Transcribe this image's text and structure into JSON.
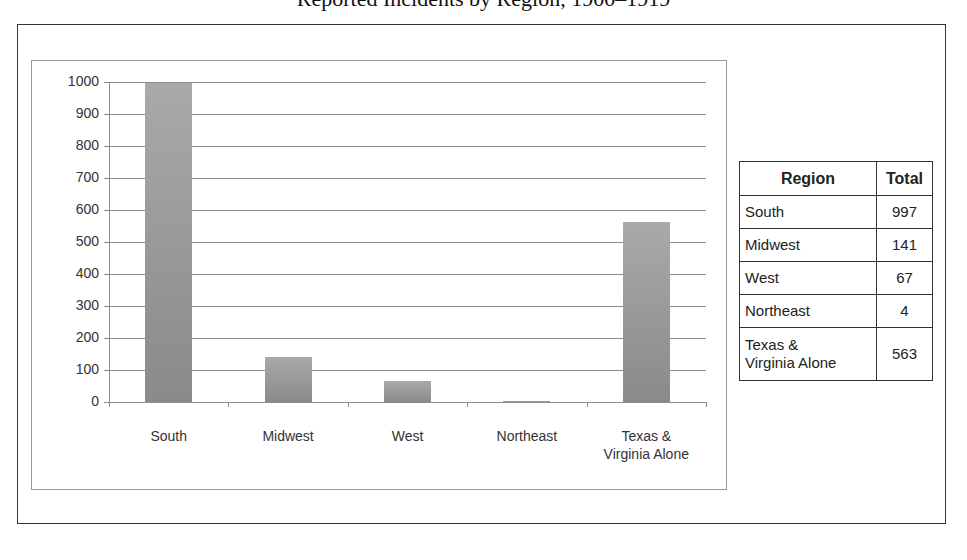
{
  "page": {
    "title": "Reported Incidents by Region, 1900–1919"
  },
  "chart_data": {
    "type": "bar",
    "title": "",
    "xlabel": "",
    "ylabel": "",
    "categories": [
      "South",
      "Midwest",
      "West",
      "Northeast",
      "Texas & Virginia Alone"
    ],
    "category_lines": [
      [
        "South"
      ],
      [
        "Midwest"
      ],
      [
        "West"
      ],
      [
        "Northeast"
      ],
      [
        "Texas &",
        "Virginia Alone"
      ]
    ],
    "values": [
      997,
      141,
      67,
      4,
      563
    ],
    "ylim": [
      0,
      1000
    ],
    "yticks": [
      0,
      100,
      200,
      300,
      400,
      500,
      600,
      700,
      800,
      900,
      1000
    ],
    "grid": true,
    "legend": null,
    "bar_color": "#999999"
  },
  "table": {
    "headers": [
      "Region",
      "Total"
    ],
    "rows": [
      {
        "region": "South",
        "total": "997"
      },
      {
        "region": "Midwest",
        "total": "141"
      },
      {
        "region": "West",
        "total": "67"
      },
      {
        "region": "Northeast",
        "total": "4"
      },
      {
        "region_lines": [
          "Texas &",
          "Virginia Alone"
        ],
        "region": "Texas & Virginia Alone",
        "total": "563"
      }
    ]
  }
}
